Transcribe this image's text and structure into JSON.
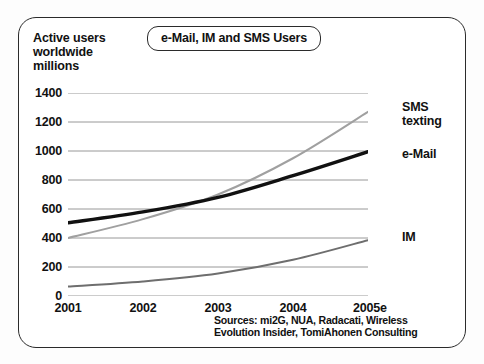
{
  "chart_data": {
    "type": "line",
    "title": "e-Mail, IM and SMS Users",
    "ylabel": "Active users\nworldwide\nmillions",
    "xlabel": "",
    "categories": [
      "2001",
      "2002",
      "2003",
      "2004",
      "2005e"
    ],
    "x": [
      2001,
      2002,
      2003,
      2004,
      2005
    ],
    "ylim": [
      0,
      1400
    ],
    "yticks": [
      0,
      200,
      400,
      600,
      800,
      1000,
      1200,
      1400
    ],
    "ytick_labels": [
      "0",
      "200",
      "400",
      "600",
      "800",
      "1000",
      "1200",
      "1400"
    ],
    "grid": true,
    "legend_position": "right-inline-labels",
    "series": [
      {
        "name": "SMS texting",
        "label": "SMS\ntexting",
        "color": "#a0a0a0",
        "values": [
          400,
          530,
          700,
          950,
          1270
        ]
      },
      {
        "name": "e-Mail",
        "label": "e-Mail",
        "color": "#111111",
        "values": [
          505,
          580,
          680,
          830,
          995
        ]
      },
      {
        "name": "IM",
        "label": "IM",
        "color": "#6e6e6e",
        "values": [
          65,
          100,
          155,
          250,
          385
        ]
      }
    ],
    "annotations": [
      "Sources: mi2G, NUA, Radacati, Wireless",
      "Evolution Insider, TomiAhonen Consulting"
    ],
    "sources_text": "Sources: mi2G, NUA, Radacati, Wireless\nEvolution Insider, TomiAhonen Consulting"
  },
  "colors": {
    "frame_border": "#2b2b2b",
    "gridline": "#8c8c8c",
    "background": "#ffffff",
    "text": "#111111"
  }
}
